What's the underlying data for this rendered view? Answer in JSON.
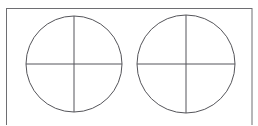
{
  "figure": {
    "title": "Two circles divided into quadrants inside a rectangular frame",
    "canvas": {
      "width": 258,
      "height": 125,
      "background": "#ffffff"
    },
    "frame": {
      "name": "outer-rectangle",
      "x": 6.5,
      "y": 8.5,
      "width": 245.5,
      "height": 122,
      "stroke": "#6e6e72",
      "stroke_width": 1,
      "fill": "#ffffff"
    },
    "shapes": [
      {
        "id": "left-circle",
        "label": "Left circle",
        "cx": 74,
        "cy": 64,
        "r": 48,
        "stroke": "#55555a",
        "stroke_width": 1,
        "fill": "none",
        "divisions": [
          {
            "id": "left-circle-vertical-diameter",
            "label": "Vertical diameter",
            "x1": 74,
            "y1": 16,
            "x2": 74,
            "y2": 112
          },
          {
            "id": "left-circle-horizontal-diameter",
            "label": "Horizontal diameter",
            "x1": 26,
            "y1": 64,
            "x2": 122,
            "y2": 64
          }
        ]
      },
      {
        "id": "right-circle",
        "label": "Right circle",
        "cx": 186,
        "cy": 64,
        "r": 49,
        "stroke": "#55555a",
        "stroke_width": 1,
        "fill": "none",
        "divisions": [
          {
            "id": "right-circle-vertical-diameter",
            "label": "Vertical diameter",
            "x1": 186,
            "y1": 15,
            "x2": 186,
            "y2": 113
          },
          {
            "id": "right-circle-horizontal-diameter",
            "label": "Horizontal diameter",
            "x1": 137,
            "y1": 64,
            "x2": 235,
            "y2": 64
          }
        ]
      }
    ]
  }
}
